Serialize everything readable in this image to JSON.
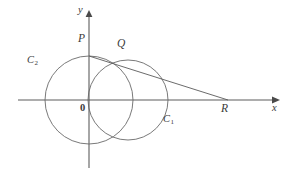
{
  "figure": {
    "background_color": "#ffffff",
    "stroke_color": "#555555",
    "label_color": "#3a3a3a",
    "axes": {
      "x_label": "x",
      "y_label": "y",
      "origin_label": "0",
      "x_axis_y": 100,
      "y_axis_x": 89,
      "x_axis_start": 18,
      "x_axis_end": 278,
      "y_axis_top": 12,
      "y_axis_bottom": 168
    },
    "points": [
      {
        "name": "P",
        "label": "P",
        "x": 89,
        "y": 56,
        "label_x": 78,
        "label_y": 38
      },
      {
        "name": "Q",
        "label": "Q",
        "x": 124,
        "y": 61,
        "label_x": 118,
        "label_y": 42
      },
      {
        "name": "R",
        "label": "R",
        "x": 228,
        "y": 100,
        "label_x": 222,
        "label_y": 105
      }
    ],
    "circles": [
      {
        "name": "C_1",
        "label": "C",
        "subscript": "1",
        "cx": 128,
        "cy": 100,
        "r": 40,
        "label_x": 164,
        "label_y": 118
      },
      {
        "name": "C_2",
        "label": "C",
        "subscript": "2",
        "cx": 89,
        "cy": 100,
        "r": 44,
        "label_x": 27,
        "label_y": 59
      }
    ],
    "lines": [
      {
        "name": "tangent-PR",
        "x1": 89,
        "y1": 56,
        "x2": 228,
        "y2": 100
      }
    ]
  }
}
